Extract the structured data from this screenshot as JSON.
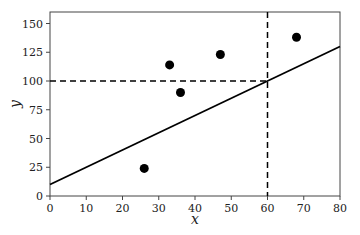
{
  "chart_data": {
    "type": "scatter",
    "title": "",
    "xlabel": "x",
    "ylabel": "y",
    "xlim": [
      0,
      80
    ],
    "ylim": [
      0,
      160
    ],
    "xticks": [
      0,
      10,
      20,
      30,
      40,
      50,
      60,
      70,
      80
    ],
    "yticks": [
      0,
      25,
      50,
      75,
      100,
      125,
      150
    ],
    "grid": false,
    "legend": null,
    "points": [
      {
        "x": 26,
        "y": 24
      },
      {
        "x": 33,
        "y": 114
      },
      {
        "x": 36,
        "y": 90
      },
      {
        "x": 47,
        "y": 123
      },
      {
        "x": 68,
        "y": 138
      }
    ],
    "line": {
      "style": "solid",
      "x": [
        0,
        80
      ],
      "y": [
        10,
        130
      ],
      "slope": 1.5,
      "intercept": 10
    },
    "reference_lines": [
      {
        "orientation": "vertical",
        "x": 60,
        "y_range": [
          0,
          160
        ],
        "style": "dashed"
      },
      {
        "orientation": "horizontal",
        "y": 100,
        "x_range": [
          0,
          60
        ],
        "style": "dashed"
      }
    ],
    "colors": {
      "points": "#000000",
      "line": "#000000",
      "axes": "#444444"
    }
  }
}
